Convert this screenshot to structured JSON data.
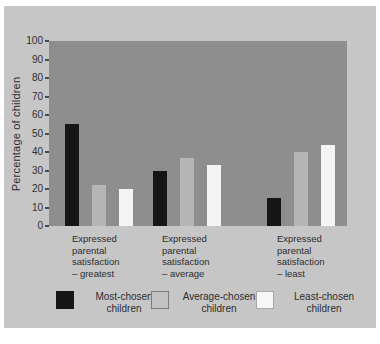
{
  "chart_data": {
    "type": "bar",
    "title": "",
    "xlabel": "",
    "ylabel": "Percentage of children",
    "ylim": [
      0,
      100
    ],
    "yticks": [
      100,
      90,
      80,
      70,
      60,
      50,
      40,
      30,
      20,
      10,
      0
    ],
    "grid": false,
    "legend_position": "bottom",
    "plot_background": "#8e8e8e",
    "card_background": "#c6c6c6",
    "categories": [
      "Expressed parental satisfaction – greatest",
      "Expressed parental satisfaction – average",
      "Expressed parental satisfaction – least"
    ],
    "category_lines": [
      [
        "Expressed",
        "parental",
        "satisfaction",
        "– greatest"
      ],
      [
        "Expressed",
        "parental",
        "satisfaction",
        "– average"
      ],
      [
        "Expressed",
        "parental",
        "satisfaction",
        "– least"
      ]
    ],
    "series": [
      {
        "name": "Most-chosen children",
        "color": "#161616",
        "values": [
          55,
          30,
          15
        ]
      },
      {
        "name": "Average-chosen children",
        "color": "#b5b5b5",
        "values": [
          22,
          37,
          40
        ]
      },
      {
        "name": "Least-chosen children",
        "color": "#f4f4f4",
        "values": [
          20,
          33,
          44
        ]
      }
    ],
    "legend": [
      {
        "label_lines": [
          "Most-chosen",
          "children"
        ],
        "swatch": "#161616",
        "border": "none"
      },
      {
        "label_lines": [
          "Average-chosen",
          "children"
        ],
        "swatch": "#c2c2c2",
        "border": "#7d7d7d"
      },
      {
        "label_lines": [
          "Least-chosen",
          "children"
        ],
        "swatch": "#f6f6f6",
        "border": "#a8a8a8"
      }
    ]
  }
}
